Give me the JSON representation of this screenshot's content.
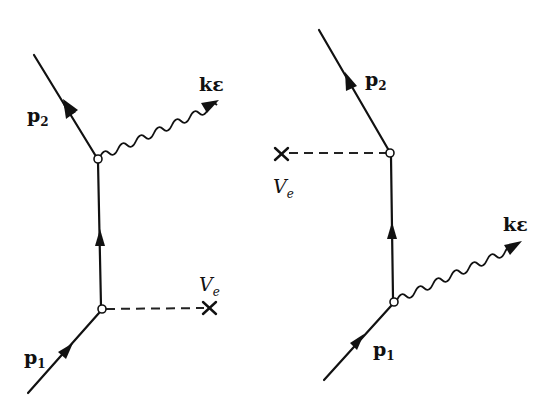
{
  "diagrams": [
    {
      "name": "left",
      "labels": {
        "outgoing_momentum": "p",
        "outgoing_sub": "2",
        "incoming_momentum": "p",
        "incoming_sub": "1",
        "photon": "kε",
        "potential": "V",
        "potential_sub": "e"
      }
    },
    {
      "name": "right",
      "labels": {
        "outgoing_momentum": "p",
        "outgoing_sub": "2",
        "incoming_momentum": "p",
        "incoming_sub": "1",
        "photon": "kε",
        "potential": "V",
        "potential_sub": "e"
      }
    }
  ]
}
